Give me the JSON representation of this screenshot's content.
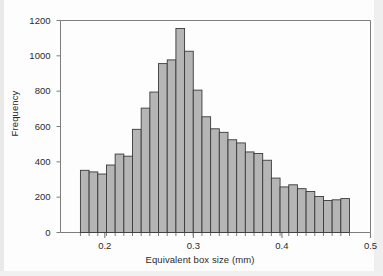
{
  "chart_data": {
    "type": "bar",
    "title": "",
    "subtitle": "",
    "xlabel": "Equivalent box size (mm)",
    "ylabel": "Frequency",
    "xlim": [
      0.15,
      0.5
    ],
    "ylim": [
      0,
      1200
    ],
    "grid": false,
    "legend": null,
    "x_major_ticks": [
      0.2,
      0.3,
      0.4,
      0.5
    ],
    "x_major_tick_labels": [
      "0.2",
      "0.3",
      "0.4",
      "0.5"
    ],
    "x_minor_tick_step": 0.01,
    "y_ticks": [
      0,
      200,
      400,
      600,
      800,
      1000,
      1200
    ],
    "y_tick_labels": [
      "0",
      "200",
      "400",
      "600",
      "800",
      "1000",
      "1200"
    ],
    "bin_width": 0.0098,
    "bin_start": 0.1725,
    "bar_fill_color": "#b5b5b5",
    "bar_edge_color": "#3a3a3a",
    "axis_color": "#7d7d7d",
    "text_color": "#2b2b2b",
    "bin_centers": [
      0.1774,
      0.1872,
      0.197,
      0.2069,
      0.2167,
      0.2265,
      0.2364,
      0.2462,
      0.256,
      0.2659,
      0.2757,
      0.2855,
      0.2954,
      0.3052,
      0.315,
      0.3249,
      0.3347,
      0.3445,
      0.3544,
      0.3642,
      0.374,
      0.3839,
      0.3937,
      0.4035,
      0.4134,
      0.4232,
      0.433,
      0.4429,
      0.4527,
      0.4625
    ],
    "values": [
      352,
      343,
      331,
      382,
      444,
      432,
      584,
      704,
      795,
      956,
      977,
      1155,
      1026,
      806,
      655,
      587,
      567,
      525,
      507,
      456,
      447,
      409,
      308,
      258,
      270,
      248,
      232,
      204,
      181,
      185,
      192
    ]
  },
  "figure": {
    "caption": ""
  }
}
